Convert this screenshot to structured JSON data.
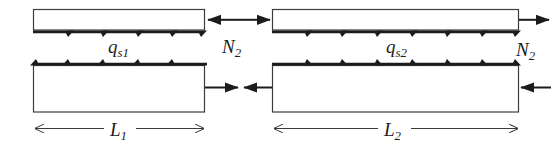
{
  "figure": {
    "background_color": "#ffffff",
    "line_color": "#1c1c1c",
    "bar_fill": "#ffffff",
    "width": 553,
    "height": 149
  },
  "labels": {
    "shear_flow_1": {
      "base": "q",
      "sub": "s1",
      "text": "q_s1"
    },
    "shear_flow_2": {
      "base": "q",
      "sub": "s2",
      "text": "q_s2"
    },
    "axial_force_mid": {
      "base": "N",
      "sub": "2",
      "text": "N_2"
    },
    "axial_force_right": {
      "base": "N",
      "sub": "2",
      "text": "N_2"
    },
    "length_1": {
      "base": "L",
      "sub": "1",
      "text": "L_1"
    },
    "length_2": {
      "base": "L",
      "sub": "2",
      "text": "L_2"
    }
  },
  "elements": {
    "top_left_bar": {
      "name": "top-left-thin-bar",
      "x": 33,
      "y": 9,
      "width": 172,
      "height": 21,
      "shear_arrow_count": 5,
      "shear_direction": "right",
      "shear_edge": "bottom",
      "end_force_direction": "left"
    },
    "top_right_bar": {
      "name": "top-right-thin-bar",
      "x": 272,
      "y": 9,
      "width": 247,
      "height": 21,
      "shear_arrow_count": 7,
      "shear_direction": "right",
      "shear_edge": "bottom",
      "end_force_direction": "right"
    },
    "bottom_left_bar": {
      "name": "bottom-left-tall-bar",
      "x": 33,
      "y": 65,
      "width": 172,
      "height": 47,
      "shear_arrow_count": 5,
      "shear_direction": "left",
      "shear_edge": "top",
      "end_force_direction": "right"
    },
    "bottom_right_bar": {
      "name": "bottom-right-tall-bar",
      "x": 272,
      "y": 65,
      "width": 247,
      "height": 47,
      "shear_arrow_count": 7,
      "shear_direction": "right",
      "shear_edge": "top",
      "end_force_direction": "left"
    },
    "dimension_1": {
      "x1": 33,
      "x2": 205,
      "y": 128
    },
    "dimension_2": {
      "x1": 272,
      "x2": 519,
      "y": 128
    }
  },
  "label_positions": {
    "shear_flow_1": {
      "left": 108,
      "top": 38
    },
    "shear_flow_2": {
      "left": 388,
      "top": 38
    },
    "axial_force_mid": {
      "left": 222,
      "top": 38
    },
    "axial_force_right": {
      "left": 516,
      "top": 40
    },
    "length_1": {
      "left": 110,
      "top": 126
    },
    "length_2": {
      "left": 383,
      "top": 126
    }
  }
}
